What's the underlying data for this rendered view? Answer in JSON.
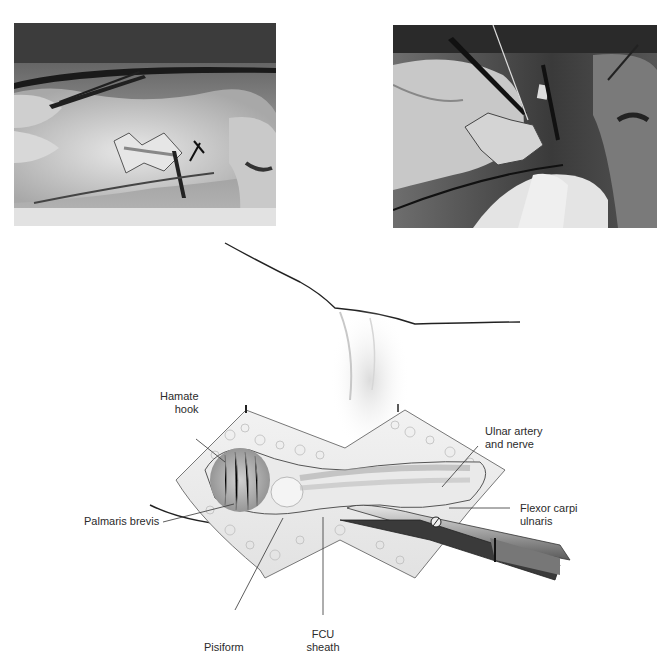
{
  "figure": {
    "panels": [
      {
        "id": "photo-left",
        "description": "Intraoperative photograph: zig-zag incision over hypothenar region with forceps, hand held by gloved fingers"
      },
      {
        "id": "photo-right",
        "description": "Intraoperative photograph: dissection with scissors and retraction of FCU sheath"
      },
      {
        "id": "illustration",
        "description": "Drawing of zig-zag incision exposing hypothenar anatomy with scissors"
      }
    ],
    "labels": {
      "hamate_hook_line1": "Hamate",
      "hamate_hook_line2": "hook",
      "palmaris_brevis": "Palmaris brevis",
      "ulnar_line1": "Ulnar artery",
      "ulnar_line2": "and nerve",
      "fcu_line1": "Flexor carpi",
      "fcu_line2": "ulnaris",
      "pisiform": "Pisiform",
      "fcu_sheath_line1": "FCU",
      "fcu_sheath_line2": "sheath"
    }
  }
}
